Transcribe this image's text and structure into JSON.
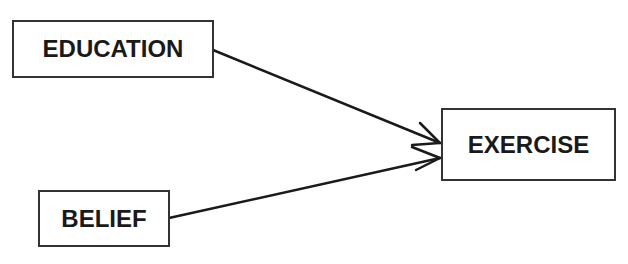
{
  "diagram": {
    "nodes": [
      {
        "id": "education",
        "label": "EDUCATION"
      },
      {
        "id": "belief",
        "label": "BELIEF"
      },
      {
        "id": "exercise",
        "label": "EXERCISE"
      }
    ],
    "edges": [
      {
        "from": "education",
        "to": "exercise"
      },
      {
        "from": "belief",
        "to": "exercise"
      }
    ],
    "colors": {
      "line": "#1a1a1a",
      "border": "#333333",
      "background": "#ffffff"
    }
  }
}
